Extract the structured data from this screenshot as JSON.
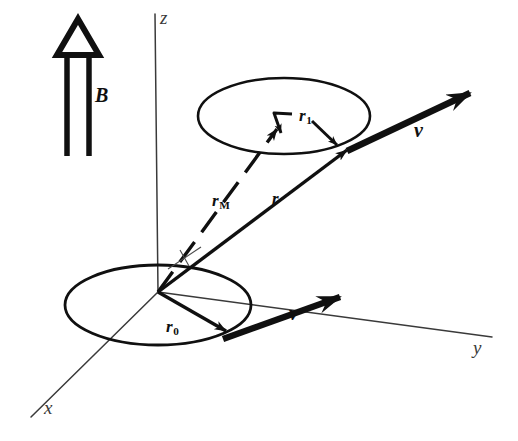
{
  "figure": {
    "background_color": "#ffffff",
    "ink_color": "#101010",
    "axis_color": "#3a3a3a",
    "width": 518,
    "height": 441
  },
  "axes": [
    {
      "name": "z",
      "label": "z",
      "label_x": 160,
      "label_y": 8,
      "x1": 158,
      "y1": 292,
      "x2": 155,
      "y2": 14
    },
    {
      "name": "y",
      "label": "y",
      "label_x": 473,
      "label_y": 338,
      "x1": 158,
      "y1": 292,
      "x2": 492,
      "y2": 337
    },
    {
      "name": "x",
      "label": "x",
      "label_x": 44,
      "label_y": 398,
      "x1": 158,
      "y1": 292,
      "x2": 31,
      "y2": 417
    }
  ],
  "field": {
    "name": "magnetic-field",
    "label": "B",
    "label_x": 95,
    "label_y": 85,
    "description": "uniform magnetic field, hollow double-shafted arrow pointing up (+z)",
    "apex_x": 78,
    "apex_y": 20,
    "base_y": 54,
    "base_left_x": 59,
    "base_right_x": 97,
    "shaft_left_x": 67,
    "shaft_right_x": 89,
    "shaft_bottom_y": 156
  },
  "orbits": [
    {
      "name": "upper-gyro-orbit",
      "cx": 284,
      "cy": 116,
      "rx": 86,
      "ry": 38,
      "description": "gyro-circle at the displaced guiding centre"
    },
    {
      "name": "lower-gyro-orbit",
      "cx": 158,
      "cy": 305,
      "rx": 93,
      "ry": 40,
      "description": "gyro-circle centred on the origin"
    }
  ],
  "vectors": [
    {
      "name": "r-M",
      "label": "r",
      "subscript": "M",
      "label_x": 212,
      "label_y": 192,
      "style": "dashed",
      "x1": 158,
      "y1": 292,
      "x2": 277,
      "y2": 129,
      "description": "guiding-centre position vector (dashed) from origin to upper orbit centre"
    },
    {
      "name": "r",
      "label": "r",
      "subscript": "",
      "label_x": 272,
      "label_y": 190,
      "style": "solid",
      "x1": 158,
      "y1": 292,
      "x2": 347,
      "y2": 150,
      "description": "particle position vector from origin to particle on upper orbit"
    },
    {
      "name": "r-1",
      "label": "r",
      "subscript": "1",
      "label_x": 299,
      "label_y": 107,
      "style": "solid-bent",
      "x1": 281,
      "y1": 133,
      "x2": 271,
      "y2": 116,
      "x3": 292,
      "y3": 114,
      "tip2_x1": 313,
      "tip2_y1": 122,
      "tip2_x2": 333,
      "tip2_y2": 141,
      "description": "gyro-radius vector from guiding centre to particle"
    },
    {
      "name": "r-0",
      "label": "r",
      "subscript": "0",
      "label_x": 166,
      "label_y": 318,
      "style": "solid",
      "x1": 158,
      "y1": 292,
      "x2": 226,
      "y2": 331,
      "description": "initial gyro-radius vector on the lower orbit"
    },
    {
      "name": "velocity-upper",
      "label": "v",
      "subscript": "",
      "label_x": 414,
      "label_y": 120,
      "style": "bold",
      "x1": 347,
      "y1": 151,
      "x2": 470,
      "y2": 93,
      "description": "particle velocity, tangent to the upper orbit"
    },
    {
      "name": "velocity-lower",
      "label": "v",
      "subscript": "",
      "label_x": 289,
      "label_y": 303,
      "style": "bold",
      "x1": 223,
      "y1": 339,
      "x2": 340,
      "y2": 297,
      "description": "initial particle velocity, tangent to the lower orbit"
    }
  ],
  "markers": [
    {
      "name": "angle-tick",
      "description": "short thin tick crossing the guiding-centre line near the origin",
      "x1": 170,
      "y1": 268,
      "x2": 199,
      "y2": 249,
      "tick_x1": 179,
      "tick_y1": 252,
      "tick_x2": 190,
      "tick_y2": 265
    }
  ]
}
